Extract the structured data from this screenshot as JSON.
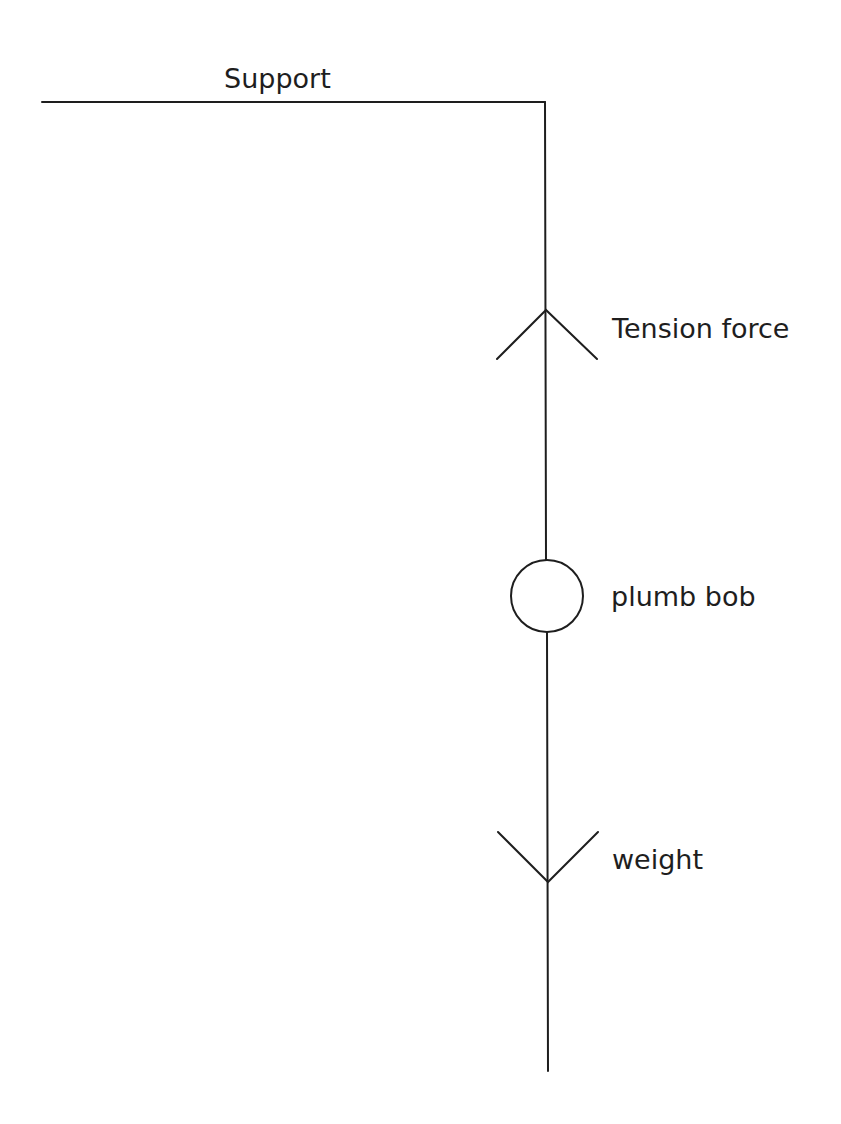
{
  "diagram": {
    "labels": {
      "support": "Support",
      "tension": "Tension force",
      "bob": "plumb bob",
      "weight": "weight"
    },
    "colors": {
      "line": "#1e1e1e",
      "background": "#ffffff"
    },
    "elements": [
      {
        "name": "support",
        "type": "line",
        "from": [
          42,
          102
        ],
        "to": [
          545,
          102
        ]
      },
      {
        "name": "string",
        "type": "line",
        "from": [
          545,
          102
        ],
        "to": [
          548,
          1071
        ]
      },
      {
        "name": "tension-arrow",
        "type": "arrowhead",
        "direction": "up",
        "apex": [
          546,
          310
        ]
      },
      {
        "name": "plumb-bob",
        "type": "circle",
        "center": [
          547,
          596
        ],
        "radius": 36
      },
      {
        "name": "weight-arrow",
        "type": "arrowhead",
        "direction": "down",
        "apex": [
          548,
          882
        ]
      }
    ]
  }
}
